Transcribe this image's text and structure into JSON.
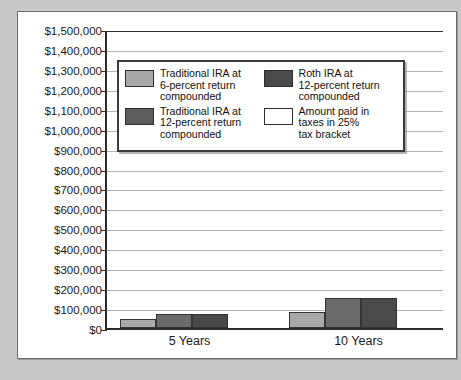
{
  "chart_data": {
    "type": "bar",
    "title": "",
    "xlabel": "",
    "ylabel": "",
    "categories": [
      "5 Years",
      "10 Years"
    ],
    "ylim": [
      0,
      1500000
    ],
    "ytick_step": 100000,
    "ytick_labels": [
      "$1,500,000",
      "$1,400,000",
      "$1,300,000",
      "$1,200,000",
      "$1,100,000",
      "$1,000,000",
      "$900,000",
      "$800,000",
      "$700,000",
      "$600,000",
      "$500,000",
      "$400,000",
      "$300,000",
      "$200,000",
      "$100,000",
      "$0"
    ],
    "ytick_values": [
      1500000,
      1400000,
      1300000,
      1200000,
      1100000,
      1000000,
      900000,
      800000,
      700000,
      600000,
      500000,
      400000,
      300000,
      200000,
      100000,
      0
    ],
    "grid": true,
    "legend_position": "inside-upper-left",
    "series": [
      {
        "name": "Traditional IRA at 6-percent return compounded",
        "color": "#a9a9a9",
        "values": [
          45000,
          80000
        ]
      },
      {
        "name": "Traditional IRA at 12-percent return compounded",
        "color": "#5d5d5d",
        "values": [
          70000,
          150000
        ]
      },
      {
        "name": "Roth IRA at 12-percent return compounded",
        "color": "#4a4a4a",
        "values": [
          70000,
          150000
        ]
      },
      {
        "name": "Amount paid in taxes in 25% tax bracket",
        "color": "#ffffff",
        "values": [
          0,
          0
        ]
      }
    ]
  },
  "legend": {
    "items": [
      {
        "label": "Traditional IRA at\n6-percent return\ncompounded",
        "swatch": "s0"
      },
      {
        "label": "Roth IRA at\n12-percent return\ncompounded",
        "swatch": "s2"
      },
      {
        "label": "Traditional IRA at\n12-percent return\ncompounded",
        "swatch": "s1"
      },
      {
        "label": "Amount paid in\ntaxes in 25%\ntax bracket",
        "swatch": "s3"
      }
    ]
  },
  "colors": {
    "page_background": "#c9c9c9",
    "panel_background": "#ffffff",
    "axis": "#2b2b2b",
    "gridline": "#b4b4b4",
    "series_light_gray": "#a9a9a9",
    "series_medium_gray": "#5d5d5d",
    "series_dark_gray": "#4a4a4a",
    "series_white": "#ffffff"
  }
}
